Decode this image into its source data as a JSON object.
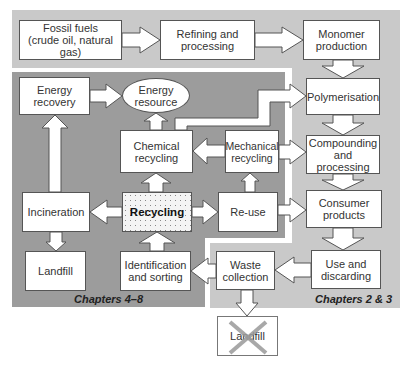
{
  "diagram": {
    "type": "flowchart",
    "colors": {
      "outer_region": "#c8c8c8",
      "inner_region": "#9a9a9a",
      "box_fill": "#ffffff",
      "box_border": "#555555",
      "cross": "#9a9a9a"
    },
    "regions": {
      "production_and_use": {
        "caption": "Chapters 2 & 3"
      },
      "recycling_and_recovery": {
        "caption": "Chapters 4–8"
      }
    },
    "nodes": {
      "fossil_fuels": {
        "line1": "Fossil fuels",
        "line2": "(crude oil, natural gas)"
      },
      "refining": {
        "line1": "Refining and",
        "line2": "processing"
      },
      "monomer": {
        "line1": "Monomer",
        "line2": "production"
      },
      "energy_recovery": {
        "line1": "Energy",
        "line2": "recovery"
      },
      "energy_resource": {
        "line1": "Energy",
        "line2": "resource"
      },
      "polymerisation": {
        "line1": "Polymerisation"
      },
      "chemical_recycling": {
        "line1": "Chemical",
        "line2": "recycling"
      },
      "mechanical_recycling": {
        "line1": "Mechanical",
        "line2": "recycling"
      },
      "compounding": {
        "line1": "Compounding",
        "line2": "and processing"
      },
      "incineration": {
        "line1": "Incineration"
      },
      "recycling": {
        "line1": "Recycling"
      },
      "reuse": {
        "line1": "Re-use"
      },
      "consumer_products": {
        "line1": "Consumer",
        "line2": "products"
      },
      "landfill_left": {
        "line1": "Landfill"
      },
      "identification": {
        "line1": "Identification",
        "line2": "and sorting"
      },
      "waste_collection": {
        "line1": "Waste",
        "line2": "collection"
      },
      "use_discarding": {
        "line1": "Use and",
        "line2": "discarding"
      },
      "landfill_crossed": {
        "line1": "Landfill"
      }
    },
    "edges": [
      [
        "Fossil fuels",
        "Refining and processing"
      ],
      [
        "Refining and processing",
        "Monomer production"
      ],
      [
        "Monomer production",
        "Polymerisation"
      ],
      [
        "Polymerisation",
        "Compounding and processing"
      ],
      [
        "Compounding and processing",
        "Consumer products"
      ],
      [
        "Consumer products",
        "Use and discarding"
      ],
      [
        "Use and discarding",
        "Waste collection"
      ],
      [
        "Waste collection",
        "Identification and sorting"
      ],
      [
        "Waste collection",
        "Landfill (crossed out)"
      ],
      [
        "Identification and sorting",
        "Recycling"
      ],
      [
        "Recycling",
        "Incineration"
      ],
      [
        "Recycling",
        "Re-use"
      ],
      [
        "Recycling",
        "Chemical recycling"
      ],
      [
        "Recycling",
        "Mechanical recycling"
      ],
      [
        "Re-use",
        "Consumer products"
      ],
      [
        "Mechanical recycling",
        "Chemical recycling"
      ],
      [
        "Mechanical recycling",
        "Compounding and processing"
      ],
      [
        "Chemical recycling",
        "Energy resource"
      ],
      [
        "Chemical recycling",
        "Polymerisation"
      ],
      [
        "Incineration",
        "Energy recovery"
      ],
      [
        "Incineration",
        "Landfill"
      ],
      [
        "Energy recovery",
        "Energy resource"
      ]
    ]
  }
}
